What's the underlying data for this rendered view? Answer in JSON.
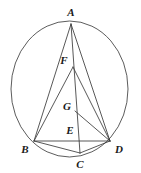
{
  "figure": {
    "type": "geometry-diagram",
    "canvas": {
      "width": 141,
      "height": 173
    },
    "colors": {
      "background": "#ffffff",
      "stroke": "#3a3a3a",
      "circle_stroke": "#4a4a4a",
      "label_color": "#1a1a1a"
    },
    "circle": {
      "name": "circumscribed-circle",
      "cx": 69.5,
      "cy": 89.0,
      "rx": 58.5,
      "ry": 68.0,
      "stroke_width": 0.9
    },
    "points": [
      {
        "id": "A",
        "label": "A",
        "x": 71,
        "y": 24,
        "label_x": 71,
        "label_y": 12,
        "on_circle": true
      },
      {
        "id": "B",
        "label": "B",
        "x": 34,
        "y": 141,
        "label_x": 25,
        "label_y": 149,
        "on_circle": true
      },
      {
        "id": "C",
        "label": "C",
        "x": 80,
        "y": 153,
        "label_x": 80,
        "label_y": 164,
        "on_circle": true
      },
      {
        "id": "D",
        "label": "D",
        "x": 110,
        "y": 141,
        "label_x": 119,
        "label_y": 149,
        "on_circle": true
      },
      {
        "id": "E",
        "label": "E",
        "x": 77,
        "y": 134,
        "label_x": 70,
        "label_y": 130,
        "on_circle": false
      },
      {
        "id": "F",
        "label": "F",
        "x": 73,
        "y": 67,
        "label_x": 64,
        "label_y": 60,
        "on_circle": false
      },
      {
        "id": "G",
        "label": "G",
        "x": 75,
        "y": 111,
        "label_x": 67,
        "label_y": 106,
        "on_circle": false
      }
    ],
    "segments": [
      {
        "name": "segment-AB",
        "from": "A",
        "to": "B",
        "x1": 71,
        "y1": 24,
        "x2": 34,
        "y2": 141
      },
      {
        "name": "segment-AC",
        "from": "A",
        "to": "C",
        "x1": 71,
        "y1": 24,
        "x2": 80,
        "y2": 153
      },
      {
        "name": "segment-AD",
        "from": "A",
        "to": "D",
        "x1": 71,
        "y1": 24,
        "x2": 110,
        "y2": 141
      },
      {
        "name": "segment-BD",
        "from": "B",
        "to": "D",
        "x1": 34,
        "y1": 141,
        "x2": 110,
        "y2": 141
      },
      {
        "name": "segment-BC",
        "from": "B",
        "to": "C",
        "x1": 34,
        "y1": 141,
        "x2": 80,
        "y2": 153
      },
      {
        "name": "segment-CD",
        "from": "C",
        "to": "D",
        "x1": 80,
        "y1": 153,
        "x2": 110,
        "y2": 141
      },
      {
        "name": "segment-FB",
        "from": "F",
        "to": "B",
        "x1": 73,
        "y1": 67,
        "x2": 34,
        "y2": 141
      },
      {
        "name": "segment-FD",
        "from": "F",
        "to": "D",
        "x1": 73,
        "y1": 67,
        "x2": 110,
        "y2": 141
      },
      {
        "name": "segment-GD",
        "from": "G",
        "to": "D",
        "x1": 75,
        "y1": 111,
        "x2": 110,
        "y2": 141
      }
    ]
  }
}
